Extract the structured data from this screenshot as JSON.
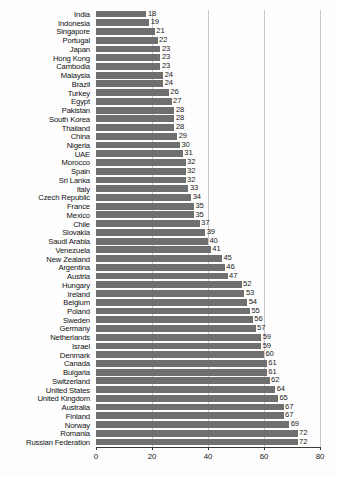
{
  "chart_data": {
    "type": "bar",
    "orientation": "horizontal",
    "title": "",
    "subtitle": "",
    "xlabel": "",
    "ylabel": "",
    "xlim": [
      0,
      80
    ],
    "xticks": [
      0,
      20,
      40,
      60,
      80
    ],
    "grid": "vertical",
    "gridlines_at": [
      20,
      40,
      60,
      80
    ],
    "legend": "none",
    "bar_color": "#6f6f6f",
    "axis_color": "#3a3a3a",
    "gridline_color": "#c9c9cc",
    "background_color": "#fdfdfd",
    "data_labels": true,
    "categories": [
      "India",
      "Indonesia",
      "Singapore",
      "Portugal",
      "Japan",
      "Hong Kong",
      "Cambodia",
      "Malaysia",
      "Brazil",
      "Turkey",
      "Egypt",
      "Pakistan",
      "South Korea",
      "Thailand",
      "China",
      "Nigeria",
      "UAE",
      "Morocco",
      "Spain",
      "Sri Lanka",
      "Italy",
      "Czech Republic",
      "France",
      "Mexico",
      "Chile",
      "Slovakia",
      "Saudi Arabia",
      "Venezuela",
      "New Zealand",
      "Argentina",
      "Austria",
      "Hungary",
      "Ireland",
      "Belgium",
      "Poland",
      "Sweden",
      "Germany",
      "Netherlands",
      "Israel",
      "Denmark",
      "Canada",
      "Bulgaria",
      "Switzerland",
      "United States",
      "United Kingdom",
      "Australia",
      "Finland",
      "Norway",
      "Romania",
      "Russian Federation"
    ],
    "values": [
      18,
      19,
      21,
      22,
      23,
      23,
      23,
      24,
      24,
      26,
      27,
      28,
      28,
      28,
      29,
      30,
      31,
      32,
      32,
      32,
      33,
      34,
      35,
      35,
      37,
      39,
      40,
      41,
      45,
      46,
      47,
      52,
      53,
      54,
      55,
      56,
      57,
      59,
      59,
      60,
      61,
      61,
      62,
      64,
      65,
      67,
      67,
      69,
      72,
      72
    ]
  }
}
